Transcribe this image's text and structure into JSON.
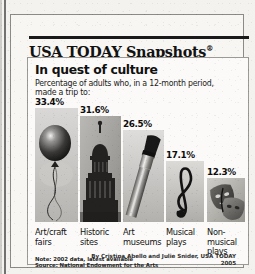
{
  "brand": {
    "name": "USA TODAY Snapshots",
    "registered_mark": "®"
  },
  "headline": "In quest of culture",
  "deck": "Percentage of adults who, in a 12-month period, made a trip to:",
  "notes": {
    "note": "Note: 2002 data, latest available",
    "source": "Source: National Endowment for the Arts"
  },
  "byline": {
    "credit": "By Cristina Abello and Julie Snider, USA TODAY",
    "year": "2005"
  },
  "chart_data": {
    "type": "bar",
    "title": "In quest of culture",
    "subtitle": "Percentage of adults who, in a 12-month period, made a trip to:",
    "xlabel": "",
    "ylabel": "Percentage of adults",
    "ylim": [
      0,
      35
    ],
    "grid": false,
    "legend": "none",
    "unit": "%",
    "categories": [
      "Art/craft fairs",
      "Historic sites",
      "Art museums",
      "Musical plays",
      "Non-musical plays"
    ],
    "values": [
      33.4,
      31.6,
      26.5,
      17.1,
      12.3
    ],
    "value_labels": [
      "33.4%",
      "31.6%",
      "26.5%",
      "17.1%",
      "12.3%"
    ],
    "bar_images": [
      "balloon-photo",
      "capitol-dome-photo",
      "paintbrush-photo",
      "treble-clef-photo",
      "theater-masks-photo"
    ],
    "note": "Note: 2002 data, latest available",
    "source": "Source: National Endowment for the Arts"
  },
  "colors": {
    "paper": "#f3f2ef",
    "panel": "#fbfaf8",
    "rule": "#1a1a1a",
    "text": "#121212",
    "photo_gray": "#8e8e8e"
  }
}
